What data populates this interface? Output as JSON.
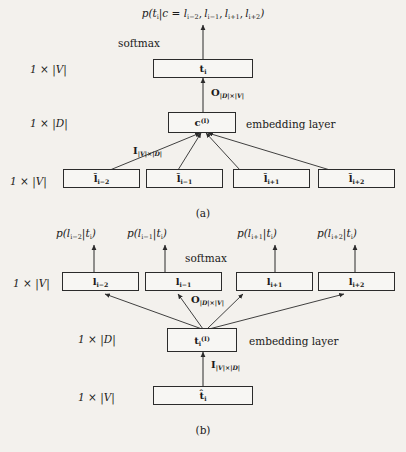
{
  "figure": {
    "type": "neural-network-architecture-diagram",
    "background_color": "#f3f1ed",
    "line_color": "#2b2b2b",
    "panels": [
      {
        "id": "a",
        "caption": "(a)",
        "model": "CBOW",
        "objective": "p(tᵢ|c = lᵢ₋₂, lᵢ₋₁, lᵢ₊₁, lᵢ₊₂)",
        "softmax_label": "softmax",
        "embedding_label": "embedding layer",
        "weight_out_label": "O|D|×|V|",
        "weight_in_label": "I|V|×|D|",
        "dims": {
          "output": "1 × |V|",
          "hidden": "1 × |D|",
          "input": "1 × |V|"
        },
        "output_node": "tᵢ",
        "hidden_node": "c(I)",
        "input_nodes": [
          "îlᵢ₋₂",
          "îlᵢ₋₁",
          "îlᵢ₊₁",
          "îlᵢ₊₂"
        ]
      },
      {
        "id": "b",
        "caption": "(b)",
        "model": "Skip-gram",
        "objectives": [
          "p(lᵢ₋₂|tᵢ)",
          "p(lᵢ₋₁|tᵢ)",
          "p(lᵢ₊₁|tᵢ)",
          "p(lᵢ₊₂|tᵢ)"
        ],
        "softmax_label": "softmax",
        "embedding_label": "embedding layer",
        "weight_out_label": "O|D|×|V|",
        "weight_in_label": "I|V|×|D|",
        "dims": {
          "output": "1 × |V|",
          "hidden": "1 × |D|",
          "input": "1 × |V|"
        },
        "output_nodes": [
          "lᵢ₋₂",
          "lᵢ₋₁",
          "lᵢ₊₁",
          "lᵢ₊₂"
        ],
        "hidden_node": "tᵢ(I)",
        "input_node": "t̂ᵢ"
      }
    ]
  },
  "panel_a": {
    "formula_top": "p(t_i|c = l_{i-2}, l_{i-1}, l_{i+1}, l_{i+2})",
    "softmax": "softmax",
    "embedding_layer": "embedding layer",
    "dim_out": "1 × |V|",
    "dim_hidden": "1 × |D|",
    "dim_in": "1 × |V|",
    "O_label": "O_{|D|×|V|}",
    "I_label": "I_{|V|×|D|}",
    "caption": "(a)"
  },
  "panel_b": {
    "p1": "p(l_{i-2}|t_i)",
    "p2": "p(l_{i-1}|t_i)",
    "p3": "p(l_{i+1}|t_i)",
    "p4": "p(l_{i+2}|t_i)",
    "softmax": "softmax",
    "embedding_layer": "embedding layer",
    "dim_out": "1 × |V|",
    "dim_hidden": "1 × |D|",
    "dim_in": "1 × |V|",
    "O_label": "O_{|D|×|V|}",
    "I_label": "I_{|V|×|D|}",
    "caption": "(b)"
  }
}
